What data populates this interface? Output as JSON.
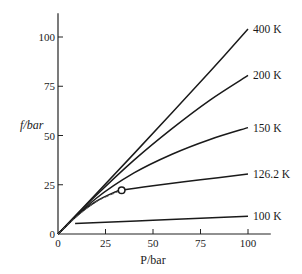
{
  "chart_data": {
    "type": "line",
    "title": "",
    "xlabel": "P/bar",
    "ylabel": "f/bar",
    "xlim": [
      0,
      112
    ],
    "ylim": [
      0,
      112
    ],
    "xticks": [
      0,
      25,
      50,
      75,
      100
    ],
    "yticks": [
      0,
      25,
      50,
      75,
      100
    ],
    "grid": false,
    "legend": "inline labels at right end of curves",
    "series": [
      {
        "name": "400 K",
        "style": "solid",
        "points": [
          [
            0,
            0
          ],
          [
            20,
            20.3
          ],
          [
            40,
            40.8
          ],
          [
            60,
            61.5
          ],
          [
            80,
            82.5
          ],
          [
            100,
            104
          ]
        ]
      },
      {
        "name": "200 K",
        "style": "solid",
        "points": [
          [
            0,
            0
          ],
          [
            20,
            19.5
          ],
          [
            40,
            37.5
          ],
          [
            60,
            53.5
          ],
          [
            80,
            68
          ],
          [
            100,
            80.5
          ]
        ]
      },
      {
        "name": "150 K",
        "style": "solid",
        "points": [
          [
            0,
            0
          ],
          [
            20,
            18
          ],
          [
            40,
            31
          ],
          [
            60,
            40.5
          ],
          [
            80,
            48
          ],
          [
            100,
            54
          ]
        ]
      },
      {
        "name": "126.2 K",
        "style": "solid",
        "points": [
          [
            0,
            0
          ],
          [
            10,
            9.3
          ],
          [
            20,
            16.5
          ],
          [
            30,
            21.3
          ],
          [
            33.5,
            22.2
          ],
          [
            50,
            24.5
          ],
          [
            75,
            27.5
          ],
          [
            100,
            30.5
          ]
        ]
      },
      {
        "name": "100 K",
        "style": "solid",
        "points": [
          [
            9,
            5.3
          ],
          [
            25,
            6
          ],
          [
            50,
            7
          ],
          [
            75,
            8
          ],
          [
            100,
            9
          ]
        ]
      },
      {
        "name": "saturation (dashed)",
        "style": "dashed",
        "points": [
          [
            0,
            0
          ],
          [
            10,
            9
          ],
          [
            20,
            16.3
          ],
          [
            30,
            20.8
          ],
          [
            33.5,
            22.2
          ]
        ]
      }
    ],
    "annotations": [
      {
        "type": "open-circle",
        "label": "critical point",
        "x": 33.5,
        "y": 22.2
      }
    ]
  }
}
